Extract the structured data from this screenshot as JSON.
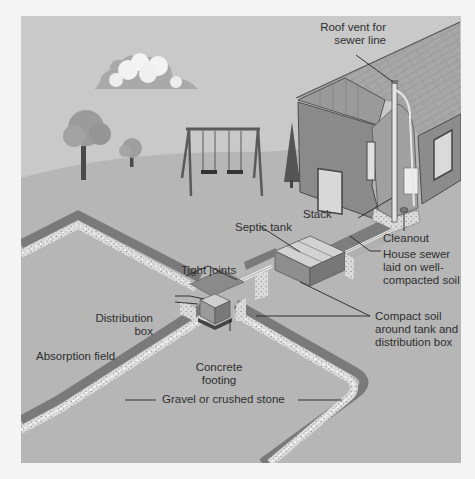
{
  "figure": {
    "colors": {
      "sky": "#c9c9c9",
      "ground": "#b6b6b6",
      "house_wall": "#8a8a8a",
      "roof": "#a4a4a4",
      "trench_dark": "#7d7d7d",
      "gravel": "#dcdcdc",
      "pipe": "#e6e6e6",
      "label_text": "#2e2e2e",
      "leader_line": "#222222"
    }
  },
  "labels": {
    "roof_vent": [
      "Roof vent for",
      "sewer line"
    ],
    "stack": "Stack",
    "cleanout": "Cleanout",
    "septic_tank": "Septic tank",
    "house_sewer": [
      "House sewer",
      "laid on well-",
      "compacted soil"
    ],
    "tight_joints": "Tight joints",
    "distribution_box": [
      "Distribution",
      "box"
    ],
    "compact_soil": [
      "Compact soil",
      "around tank and",
      "distribution box"
    ],
    "absorption_field": "Absorption field",
    "concrete_footing": [
      "Concrete",
      "footing"
    ],
    "gravel": "Gravel or crushed stone"
  }
}
